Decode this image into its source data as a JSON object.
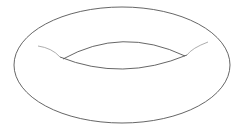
{
  "figure": {
    "stroke_color": "#555555",
    "highlight_color": "#999999",
    "background": "#ffffff"
  }
}
